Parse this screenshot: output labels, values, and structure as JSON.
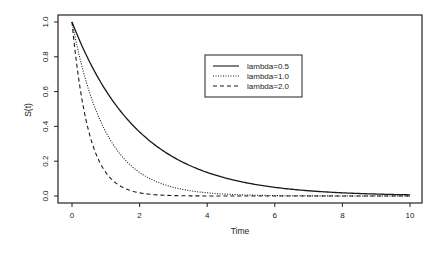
{
  "chart_data": {
    "type": "line",
    "title": "",
    "xlabel": "Time",
    "ylabel": "S(t)",
    "xlim": [
      0,
      10
    ],
    "ylim": [
      0,
      1
    ],
    "x_ticks": [
      0,
      2,
      4,
      6,
      8,
      10
    ],
    "y_ticks": [
      "0.0",
      "0.2",
      "0.4",
      "0.6",
      "0.8",
      "1.0"
    ],
    "grid": false,
    "legend_position": "upper-center-right",
    "function": "S(t) = exp(-lambda * t)",
    "series": [
      {
        "name": "lambda=0.5",
        "lambda": 0.5,
        "style": "solid",
        "x": [
          0,
          1,
          2,
          3,
          4,
          5,
          6,
          7,
          8,
          9,
          10
        ],
        "values": [
          1.0,
          0.607,
          0.368,
          0.223,
          0.135,
          0.082,
          0.05,
          0.03,
          0.018,
          0.011,
          0.007
        ]
      },
      {
        "name": "lambda=1.0",
        "lambda": 1.0,
        "style": "dotted",
        "x": [
          0,
          1,
          2,
          3,
          4,
          5,
          6,
          7,
          8,
          9,
          10
        ],
        "values": [
          1.0,
          0.368,
          0.135,
          0.05,
          0.018,
          0.007,
          0.002,
          0.001,
          0.0,
          0.0,
          0.0
        ]
      },
      {
        "name": "lambda=2.0",
        "lambda": 2.0,
        "style": "dashed",
        "x": [
          0,
          1,
          2,
          3,
          4,
          5,
          6,
          7,
          8,
          9,
          10
        ],
        "values": [
          1.0,
          0.135,
          0.018,
          0.002,
          0.0,
          0.0,
          0.0,
          0.0,
          0.0,
          0.0,
          0.0
        ]
      }
    ]
  },
  "legend": {
    "items": [
      {
        "label": "lambda=0.5",
        "style": "solid"
      },
      {
        "label": "lambda=1.0",
        "style": "dotted"
      },
      {
        "label": "lambda=2.0",
        "style": "dashed"
      }
    ]
  },
  "colors": {
    "line": "#1a1a1a",
    "frame": "#222222",
    "background": "#ffffff"
  }
}
